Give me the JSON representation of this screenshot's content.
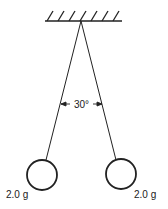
{
  "diagram": {
    "colors": {
      "stroke": "#222222",
      "background": "#ffffff"
    },
    "support": {
      "hatch_count": 7
    },
    "angle_label": "30°",
    "spheres": [
      {
        "id": "left",
        "mass_label": "2.0 g"
      },
      {
        "id": "right",
        "mass_label": "2.0 g"
      }
    ]
  }
}
